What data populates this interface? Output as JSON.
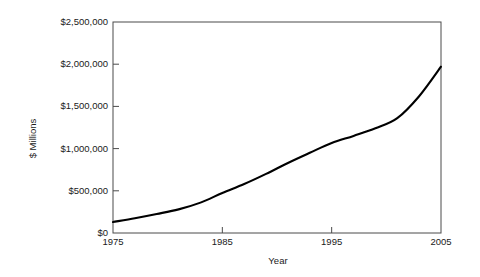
{
  "chart_data": {
    "type": "line",
    "title": "",
    "xlabel": "Year",
    "ylabel": "$ Millions",
    "xlim": [
      1975,
      2005
    ],
    "ylim": [
      0,
      2500000
    ],
    "grid": false,
    "legend": null,
    "xticks": [
      1975,
      1985,
      1995,
      2005
    ],
    "xtick_labels": [
      "1975",
      "1985",
      "1995",
      "2005"
    ],
    "yticks": [
      0,
      500000,
      1000000,
      1500000,
      2000000,
      2500000
    ],
    "ytick_labels": [
      "$0",
      "$500,000",
      "$1,000,000",
      "$1,500,000",
      "$2,000,000",
      "$2,500,000"
    ],
    "series": [
      {
        "name": "value",
        "color": "#000000",
        "x": [
          1975,
          1977,
          1979,
          1981,
          1983,
          1985,
          1987,
          1989,
          1991,
          1993,
          1995,
          1997,
          1999,
          2001,
          2003,
          2005
        ],
        "values": [
          130000,
          175000,
          225000,
          280000,
          360000,
          474000,
          580000,
          700000,
          830000,
          950000,
          1066000,
          1150000,
          1240000,
          1360000,
          1620000,
          1970000
        ]
      }
    ],
    "annotations": []
  },
  "axis": {
    "y_label_text": "$ Millions",
    "x_label_text": "Year"
  },
  "style": {
    "line_color": "#000000",
    "frame_color": "#4a4a4a",
    "text_color": "#1b1b1b",
    "background": "#ffffff"
  }
}
